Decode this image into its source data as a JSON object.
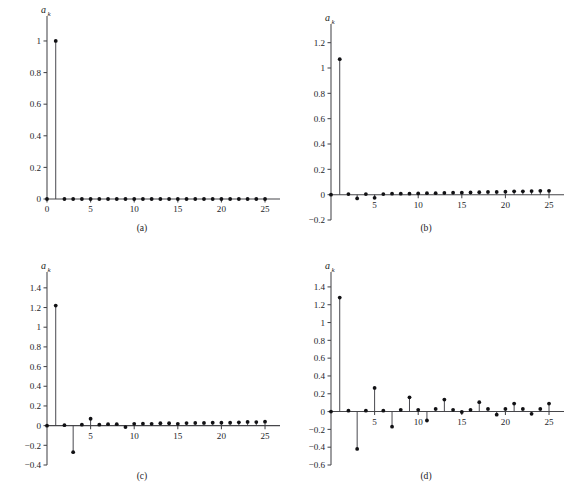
{
  "figure": {
    "background": "#ffffff",
    "stem_color": "#3f3f46",
    "dot_color": "#111114",
    "axis_color": "#46464a",
    "y_axis_label": "a",
    "y_axis_subscript": "k",
    "x_axis_label": "k"
  },
  "panels": [
    {
      "id": "a",
      "caption": "(a)"
    },
    {
      "id": "b",
      "caption": "(b)"
    },
    {
      "id": "c",
      "caption": "(c)"
    },
    {
      "id": "d",
      "caption": "(d)"
    }
  ],
  "chart_data": [
    {
      "type": "line",
      "panel": "a",
      "title": "(a)",
      "xlabel": "k",
      "ylabel": "a_k",
      "xlim": [
        0,
        25.8
      ],
      "ylim": [
        0,
        1.12
      ],
      "xticks": [
        0,
        5,
        10,
        15,
        20,
        25
      ],
      "xticklabels": [
        "0",
        "5",
        "10",
        "15",
        "20",
        "25"
      ],
      "yticks": [
        0,
        0.2,
        0.4,
        0.6,
        0.8,
        1
      ],
      "yticklabels": [
        "0",
        "0.2",
        "0.4",
        "0.6",
        "0.8",
        "1"
      ],
      "grid": false,
      "legend": "none",
      "x": [
        0,
        1,
        2,
        3,
        4,
        5,
        6,
        7,
        8,
        9,
        10,
        11,
        12,
        13,
        14,
        15,
        16,
        17,
        18,
        19,
        20,
        21,
        22,
        23,
        24,
        25
      ],
      "values": [
        0,
        1,
        0,
        0,
        0,
        0,
        0,
        0,
        0,
        0,
        0,
        0,
        0,
        0,
        0,
        0,
        0,
        0,
        0,
        0,
        0,
        0,
        0,
        0,
        0,
        0
      ]
    },
    {
      "type": "line",
      "panel": "b",
      "title": "(b)",
      "xlabel": "k",
      "ylabel": "a_k",
      "xlim": [
        0,
        25.8
      ],
      "ylim": [
        -0.2,
        1.3
      ],
      "xticks": [
        5,
        10,
        15,
        20,
        25
      ],
      "xticklabels": [
        "5",
        "10",
        "15",
        "20",
        "25"
      ],
      "yticks": [
        -0.2,
        0,
        0.2,
        0.4,
        0.6,
        0.8,
        1,
        1.2
      ],
      "yticklabels": [
        "−0.2",
        "0",
        "0.2",
        "0.4",
        "0.6",
        "0.8",
        "1",
        "1.2"
      ],
      "grid": false,
      "legend": "none",
      "x": [
        0,
        1,
        2,
        3,
        4,
        5,
        6,
        7,
        8,
        9,
        10,
        11,
        12,
        13,
        14,
        15,
        16,
        17,
        18,
        19,
        20,
        21,
        22,
        23,
        24,
        25
      ],
      "values": [
        0,
        1.07,
        0.005,
        -0.03,
        0.005,
        -0.025,
        0.005,
        0.008,
        0.008,
        0.008,
        0.01,
        0.012,
        0.012,
        0.014,
        0.016,
        0.016,
        0.018,
        0.02,
        0.022,
        0.022,
        0.024,
        0.026,
        0.026,
        0.028,
        0.03,
        0.03
      ]
    },
    {
      "type": "line",
      "panel": "c",
      "title": "(c)",
      "xlabel": "k",
      "ylabel": "a_k",
      "xlim": [
        0,
        25.8
      ],
      "ylim": [
        -0.4,
        1.5
      ],
      "xticks": [
        5,
        10,
        15,
        20,
        25
      ],
      "xticklabels": [
        "5",
        "10",
        "15",
        "20",
        "25"
      ],
      "yticks": [
        -0.4,
        -0.2,
        0,
        0.2,
        0.4,
        0.6,
        0.8,
        1,
        1.2,
        1.4
      ],
      "yticklabels": [
        "−0.4",
        "−0.2",
        "0",
        "0.2",
        "0.4",
        "0.6",
        "0.8",
        "1",
        "1.2",
        "1.4"
      ],
      "grid": false,
      "legend": "none",
      "x": [
        0,
        1,
        2,
        3,
        4,
        5,
        6,
        7,
        8,
        9,
        10,
        11,
        12,
        13,
        14,
        15,
        16,
        17,
        18,
        19,
        20,
        21,
        22,
        23,
        24,
        25
      ],
      "values": [
        0,
        1.22,
        0.005,
        -0.27,
        0.01,
        0.07,
        0.01,
        0.015,
        0.015,
        -0.015,
        0.018,
        0.02,
        0.018,
        0.024,
        0.024,
        0.018,
        0.026,
        0.028,
        0.028,
        0.03,
        0.03,
        0.03,
        0.034,
        0.038,
        0.036,
        0.04
      ]
    },
    {
      "type": "line",
      "panel": "d",
      "title": "(d)",
      "xlabel": "k",
      "ylabel": "a_k",
      "xlim": [
        0,
        25.8
      ],
      "ylim": [
        -0.6,
        1.5
      ],
      "xticks": [
        5,
        10,
        15,
        20,
        25
      ],
      "xticklabels": [
        "5",
        "10",
        "15",
        "20",
        "25"
      ],
      "yticks": [
        -0.6,
        -0.4,
        -0.2,
        0,
        0.2,
        0.4,
        0.6,
        0.8,
        1,
        1.2,
        1.4
      ],
      "yticklabels": [
        "−0.6",
        "−0.4",
        "−0.2",
        "0",
        "0.2",
        "0.4",
        "0.6",
        "0.8",
        "1",
        "1.2",
        "1.4"
      ],
      "grid": false,
      "legend": "none",
      "x": [
        0,
        1,
        2,
        3,
        4,
        5,
        6,
        7,
        8,
        9,
        10,
        11,
        12,
        13,
        14,
        15,
        16,
        17,
        18,
        19,
        20,
        21,
        22,
        23,
        24,
        25
      ],
      "values": [
        0,
        1.28,
        0.01,
        -0.42,
        0.01,
        0.265,
        0.01,
        -0.17,
        0.02,
        0.16,
        0.02,
        -0.1,
        0.03,
        0.135,
        0.02,
        -0.005,
        0.02,
        0.105,
        0.03,
        -0.035,
        0.03,
        0.09,
        0.03,
        -0.025,
        0.03,
        0.09
      ]
    }
  ]
}
